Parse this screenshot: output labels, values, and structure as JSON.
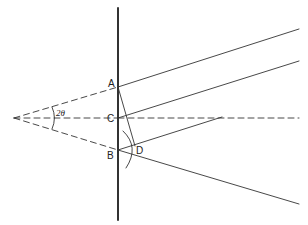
{
  "diagram": {
    "type": "geometric-optics",
    "labels": {
      "A": "A",
      "B": "B",
      "C": "C",
      "D": "D",
      "angle": "2θ"
    },
    "colors": {
      "stroke": "#333333",
      "background": "#ffffff"
    },
    "points": {
      "apex": [
        14,
        118
      ],
      "A": [
        118,
        87
      ],
      "C": [
        118,
        118
      ],
      "B": [
        118,
        150
      ],
      "D": [
        135,
        146
      ]
    },
    "lines": [
      {
        "name": "mirror",
        "from": [
          118,
          8
        ],
        "to": [
          118,
          220
        ],
        "style": "solid-thick"
      },
      {
        "name": "apex-to-A",
        "from": [
          14,
          118
        ],
        "to": [
          118,
          87
        ],
        "style": "dashed"
      },
      {
        "name": "apex-to-C",
        "from": [
          14,
          118
        ],
        "to": [
          118,
          118
        ],
        "style": "dashed"
      },
      {
        "name": "apex-to-B",
        "from": [
          14,
          118
        ],
        "to": [
          118,
          150
        ],
        "style": "dashed"
      },
      {
        "name": "ray-A",
        "from": [
          118,
          87
        ],
        "to": [
          299,
          29
        ],
        "style": "solid"
      },
      {
        "name": "ray-C",
        "from": [
          118,
          118
        ],
        "to": [
          299,
          61
        ],
        "style": "solid"
      },
      {
        "name": "axis-C",
        "from": [
          118,
          118
        ],
        "to": [
          299,
          118
        ],
        "style": "dashed"
      },
      {
        "name": "ray-B",
        "from": [
          118,
          150
        ],
        "to": [
          222,
          117
        ],
        "style": "solid"
      },
      {
        "name": "ray-D",
        "from": [
          118,
          150
        ],
        "to": [
          299,
          204
        ],
        "style": "solid"
      },
      {
        "name": "A-to-D",
        "from": [
          118,
          87
        ],
        "to": [
          135,
          146
        ],
        "style": "solid"
      }
    ]
  }
}
